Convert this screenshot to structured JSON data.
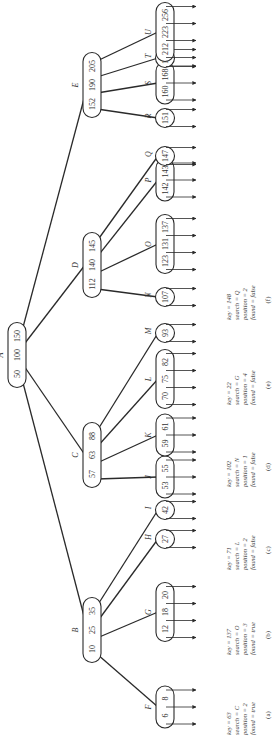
{
  "figure": {
    "orientation": "rotated-90-ccw",
    "root": {
      "label": "A",
      "keys": [
        "50",
        "100",
        "150"
      ]
    },
    "level1": [
      {
        "label": "B",
        "keys": [
          "10",
          "25",
          "35"
        ]
      },
      {
        "label": "C",
        "keys": [
          "57",
          "63",
          "88"
        ]
      },
      {
        "label": "D",
        "keys": [
          "112",
          "140",
          "145"
        ]
      },
      {
        "label": "E",
        "keys": [
          "152",
          "190",
          "205"
        ]
      }
    ],
    "leaves": [
      {
        "label": "F",
        "keys": [
          "6",
          "8"
        ]
      },
      {
        "label": "G",
        "keys": [
          "12",
          "18",
          "20"
        ]
      },
      {
        "label": "H",
        "keys": [
          "27"
        ]
      },
      {
        "label": "I",
        "keys": [
          "42"
        ]
      },
      {
        "label": "J",
        "keys": [
          "53",
          "55"
        ]
      },
      {
        "label": "K",
        "keys": [
          "59",
          "61"
        ]
      },
      {
        "label": "L",
        "keys": [
          "70",
          "75",
          "82"
        ]
      },
      {
        "label": "M",
        "keys": [
          "93"
        ]
      },
      {
        "label": "N",
        "keys": [
          "107"
        ]
      },
      {
        "label": "O",
        "keys": [
          "123",
          "131",
          "137"
        ]
      },
      {
        "label": "P",
        "keys": [
          "142",
          "143"
        ]
      },
      {
        "label": "Q",
        "keys": [
          "147"
        ]
      },
      {
        "label": "R",
        "keys": [
          "151"
        ]
      },
      {
        "label": "S",
        "keys": [
          "160",
          "168"
        ]
      },
      {
        "label": "T",
        "keys": [
          "197"
        ]
      },
      {
        "label": "U",
        "keys": [
          "212",
          "223",
          "256"
        ]
      }
    ],
    "searches": [
      {
        "caption": "(a)",
        "lines": [
          "key = 63",
          "search = C",
          "position = 2",
          "found = true"
        ]
      },
      {
        "caption": "(b)",
        "lines": [
          "key = 137",
          "search = O",
          "position = 3",
          "found = true"
        ]
      },
      {
        "caption": "(c)",
        "lines": [
          "key = 71",
          "search = L",
          "position = 2",
          "found = false"
        ]
      },
      {
        "caption": "(d)",
        "lines": [
          "key = 102",
          "search = N",
          "position = 1",
          "found = false"
        ]
      },
      {
        "caption": "(e)",
        "lines": [
          "key = 22",
          "search = G",
          "position = 4",
          "found = false"
        ]
      },
      {
        "caption": "(f)",
        "lines": [
          "key = 148",
          "search = Q",
          "position = 2",
          "found = false"
        ]
      }
    ]
  }
}
